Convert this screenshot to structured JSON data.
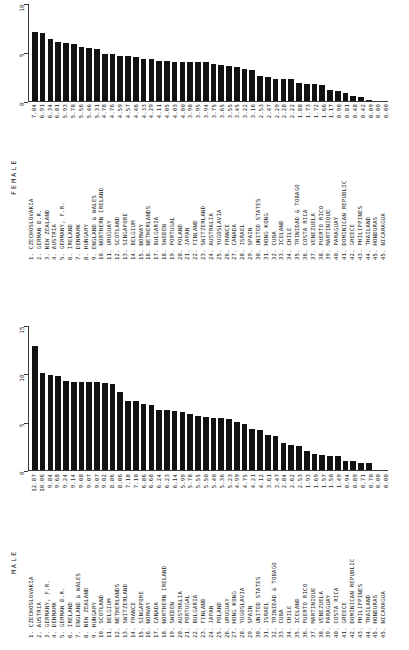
{
  "chart_data": [
    {
      "type": "bar",
      "title": "FEMALE",
      "xlabel": "",
      "ylabel": "",
      "ylim": [
        0,
        10
      ],
      "yticks": [
        0,
        5,
        10
      ],
      "ytick_labels": [
        "0",
        "5",
        "10"
      ],
      "grid": false,
      "legend": "none",
      "orientation": "vertical",
      "categories": [
        "CZECHOSLOVAKIA",
        "GERMAN D.R.",
        "NEW ZEALAND",
        "AUSTRIA",
        "GERMANY, F.R.",
        "IRELAND",
        "DENMARK",
        "HUNGARY",
        "ENGLAND & WALES",
        "NORTHERN IRELAND",
        "URUGUAY",
        "SCOTLAND",
        "SINGAPORE",
        "BELGIUM",
        "NORWAY",
        "NETHERLANDS",
        "BULGARIA",
        "SWEDEN",
        "PORTUGAL",
        "POLAND",
        "JAPAN",
        "FINLAND",
        "SWITZERLAND",
        "AUSTRALIA",
        "YUGOSLAVIA",
        "FRANCE",
        "CANADA",
        "ISRAEL",
        "SPAIN",
        "UNITED STATES",
        "HONG KONG",
        "CUBA",
        "ICELAND",
        "CHILE",
        "TRINIDAD & TOBAGO",
        "COSTA RICA",
        "VENEZUELA",
        "PUERTO RICO",
        "MARTINIQUE",
        "PARAGUAY",
        "DOMINICAN REPUBLIC",
        "GREECE",
        "PHILIPPINES",
        "THAILAND",
        "HONDURAS",
        "NICARAGUA"
      ],
      "values": [
        7.04,
        6.91,
        6.34,
        6.01,
        5.93,
        5.78,
        5.56,
        5.46,
        5.31,
        4.78,
        4.76,
        4.59,
        4.57,
        4.46,
        4.33,
        4.29,
        4.11,
        4.05,
        4.03,
        4.0,
        3.98,
        3.95,
        3.94,
        3.75,
        3.65,
        3.55,
        3.45,
        3.22,
        3.16,
        2.53,
        2.47,
        2.29,
        2.28,
        2.22,
        1.88,
        1.73,
        1.72,
        1.66,
        1.17,
        0.98,
        0.81,
        0.48,
        0.42,
        0.09,
        0.0,
        0.0
      ],
      "value_labels": [
        "7.04",
        "6.91",
        "6.34",
        "6.01",
        "5.93",
        "5.78",
        "5.56",
        "5.46",
        "5.31",
        "4.78",
        "4.76",
        "4.59",
        "4.57",
        "4.46",
        "4.33",
        "4.29",
        "4.11",
        "4.05",
        "4.03",
        "4.00",
        "3.98",
        "3.95",
        "3.94",
        "3.75",
        "3.65",
        "3.55",
        "3.45",
        "3.22",
        "3.16",
        "2.53",
        "2.47",
        "2.29",
        "2.28",
        "2.22",
        "1.88",
        "1.73",
        "1.72",
        "1.66",
        "1.17",
        "0.98",
        "0.81",
        "0.48",
        "0.42",
        "0.09",
        "0.00",
        "0.00"
      ],
      "ranked_labels": [
        "1. CZECHOSLOVAKIA",
        "2. GERMAN D.R.",
        "3. NEW ZEALAND",
        "4. AUSTRIA",
        "5. GERMANY, F.R.",
        "6. IRELAND",
        "7. DENMARK",
        "8. HUNGARY",
        "9. ENGLAND & WALES",
        "10. NORTHERN IRELAND",
        "11. URUGUAY",
        "12. SCOTLAND",
        "13. SINGAPORE",
        "14. BELGIUM",
        "15. NORWAY",
        "16. NETHERLANDS",
        "17. BULGARIA",
        "18. SWEDEN",
        "19. PORTUGAL",
        "20. POLAND",
        "21. JAPAN",
        "22. FINLAND",
        "23. SWITZERLAND",
        "24. AUSTRALIA",
        "25. YUGOSLAVIA",
        "26. FRANCE",
        "27. CANADA",
        "28. ISRAEL",
        "29. SPAIN",
        "30. UNITED STATES",
        "31. HONG KONG",
        "32. CUBA",
        "33. ICELAND",
        "34. CHILE",
        "35. TRINIDAD & TOBAGO",
        "36. COSTA RICA",
        "37. VENEZUELA",
        "38. PUERTO RICO",
        "39. MARTINIQUE",
        "40. PARAGUAY",
        "41. DOMINICAN REPUBLIC",
        "42. GREECE",
        "43. PHILIPPINES",
        "44. THAILAND",
        "45. HONDURAS",
        "45. NICARAGUA"
      ]
    },
    {
      "type": "bar",
      "title": "MALE",
      "xlabel": "",
      "ylabel": "",
      "ylim": [
        0,
        15
      ],
      "yticks": [
        0,
        5,
        10,
        15
      ],
      "ytick_labels": [
        "0",
        "5",
        "10",
        "15"
      ],
      "grid": false,
      "legend": "none",
      "orientation": "vertical",
      "categories": [
        "CZECHOSLOVAKIA",
        "AUSTRIA",
        "GERMANY, F.R.",
        "DENMARK",
        "GERMAN D.R.",
        "IRELAND",
        "ENGLAND & WALES",
        "NEW ZEALAND",
        "HUNGARY",
        "SCOTLAND",
        "BELGIUM",
        "NETHERLANDS",
        "SWITZERLAND",
        "FRANCE",
        "SINGAPORE",
        "NORWAY",
        "CANADA",
        "NORTHERN IRELAND",
        "SWEDEN",
        "AUSTRALIA",
        "PORTUGAL",
        "BULGARIA",
        "FINLAND",
        "JAPAN",
        "POLAND",
        "URUGUAY",
        "HONG KONG",
        "YUGOSLAVIA",
        "SPAIN",
        "UNITED STATES",
        "ISRAEL",
        "TRINIDAD & TOBAGO",
        "CUBA",
        "CHILE",
        "ICELAND",
        "PUERTO RICO",
        "MARTINIQUE",
        "VENEZUELA",
        "PARAGUAY",
        "COSTA RICA",
        "GREECE",
        "DOMINICAN REPUBLIC",
        "PHILIPPINES",
        "THAILAND",
        "HONDURAS",
        "NICARAGUA"
      ],
      "values": [
        12.87,
        10.06,
        9.84,
        9.68,
        9.24,
        9.14,
        9.08,
        9.07,
        9.07,
        9.02,
        8.86,
        8.06,
        7.18,
        7.1,
        6.86,
        6.68,
        6.24,
        6.23,
        6.14,
        5.99,
        5.78,
        5.55,
        5.5,
        5.4,
        5.36,
        5.23,
        4.99,
        4.75,
        4.21,
        4.12,
        3.61,
        3.47,
        2.84,
        2.62,
        2.53,
        1.93,
        1.69,
        1.57,
        1.5,
        1.49,
        0.94,
        0.89,
        0.71,
        0.7,
        0.0,
        0.0
      ],
      "value_labels": [
        "12.87",
        "10.06",
        "9.84",
        "9.68",
        "9.24",
        "9.14",
        "9.08",
        "9.07",
        "9.07",
        "9.02",
        "8.86",
        "8.06",
        "7.18",
        "7.10",
        "6.86",
        "6.68",
        "6.24",
        "6.23",
        "6.14",
        "5.99",
        "5.78",
        "5.55",
        "5.50",
        "5.40",
        "5.36",
        "5.23",
        "4.99",
        "4.75",
        "4.21",
        "4.12",
        "3.61",
        "3.47",
        "2.84",
        "2.62",
        "2.53",
        "1.93",
        "1.69",
        "1.57",
        "1.50",
        "1.49",
        "0.94",
        "0.89",
        "0.71",
        "0.70",
        "0.00",
        "0.00"
      ],
      "ranked_labels": [
        "1. CZECHOSLOVAKIA",
        "2. AUSTRIA",
        "3. GERMANY, F.R.",
        "4. DENMARK",
        "5. GERMAN D.R.",
        "6. IRELAND",
        "7. ENGLAND & WALES",
        "8. NEW ZEALAND",
        "9. HUNGARY",
        "10. SCOTLAND",
        "11. BELGIUM",
        "12. NETHERLANDS",
        "13. SWITZERLAND",
        "14. FRANCE",
        "15. SINGAPORE",
        "16. NORWAY",
        "17. CANADA",
        "18. NORTHERN IRELAND",
        "19. SWEDEN",
        "20. AUSTRALIA",
        "21. PORTUGAL",
        "22. BULGARIA",
        "23. FINLAND",
        "24. JAPAN",
        "25. POLAND",
        "26. URUGUAY",
        "27. HONG KONG",
        "28. YUGOSLAVIA",
        "29. SPAIN",
        "30. UNITED STATES",
        "31. ISRAEL",
        "32. TRINIDAD & TOBAGO",
        "33. CUBA",
        "34. CHILE",
        "35. ICELAND",
        "36. PUERTO RICO",
        "37. MARTINIQUE",
        "38. VENEZUELA",
        "39. PARAGUAY",
        "40. COSTA RICA",
        "41. GREECE",
        "42. DOMINICAN REPUBLIC",
        "43. PHILIPPINES",
        "44. THAILAND",
        "45. HONDURAS",
        "45. NICARAGUA"
      ]
    }
  ]
}
